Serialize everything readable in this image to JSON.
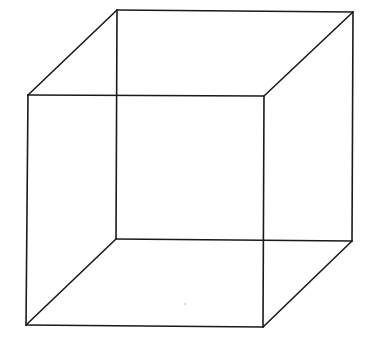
{
  "diagram": {
    "title": "Necker cube",
    "type": "wireframe-cube",
    "stroke_color": "#1a1a1a",
    "background_color": "#ffffff",
    "stroke_width": 1.6,
    "vertices": {
      "front_top_left": [
        28,
        95
      ],
      "front_top_right": [
        264,
        96
      ],
      "front_bottom_left": [
        26,
        325
      ],
      "front_bottom_right": [
        263,
        327
      ],
      "back_top_left": [
        117,
        10
      ],
      "back_top_right": [
        353,
        12
      ],
      "back_bottom_left": [
        116,
        239
      ],
      "back_bottom_right": [
        352,
        241
      ]
    },
    "edges": [
      [
        "front_top_left",
        "front_top_right"
      ],
      [
        "front_top_right",
        "front_bottom_right"
      ],
      [
        "front_bottom_right",
        "front_bottom_left"
      ],
      [
        "front_bottom_left",
        "front_top_left"
      ],
      [
        "back_top_left",
        "back_top_right"
      ],
      [
        "back_top_right",
        "back_bottom_right"
      ],
      [
        "back_bottom_right",
        "back_bottom_left"
      ],
      [
        "back_bottom_left",
        "back_top_left"
      ],
      [
        "front_top_left",
        "back_top_left"
      ],
      [
        "front_top_right",
        "back_top_right"
      ],
      [
        "front_bottom_left",
        "back_bottom_left"
      ],
      [
        "front_bottom_right",
        "back_bottom_right"
      ]
    ],
    "specks": [
      [
        185,
        304
      ]
    ]
  }
}
